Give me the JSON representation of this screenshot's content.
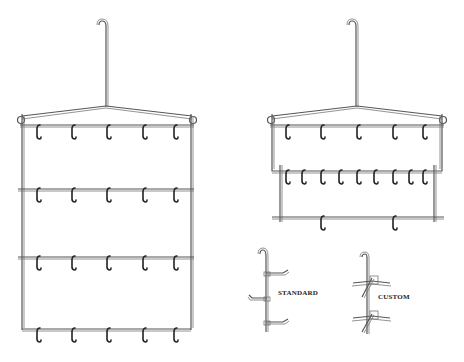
{
  "figure": {
    "left_rack": {
      "name": "four-tier hook rack",
      "tiers": [
        {
          "y": 127,
          "hooks": [
            38,
            73,
            108,
            144,
            175
          ]
        },
        {
          "y": 190,
          "hooks": [
            38,
            73,
            108,
            144,
            175
          ]
        },
        {
          "y": 258,
          "hooks": [
            38,
            73,
            108,
            144,
            175
          ]
        },
        {
          "y": 330,
          "hooks": [
            38,
            73,
            108,
            144,
            175
          ]
        }
      ]
    },
    "right_rack": {
      "name": "three-tier extended hook rack",
      "tiers": [
        {
          "y": 127,
          "hooks": [
            287,
            322,
            358,
            394,
            424
          ]
        },
        {
          "y": 172,
          "hooks": [
            287,
            303,
            322,
            340,
            358,
            375,
            394,
            410,
            424
          ]
        },
        {
          "y": 218,
          "hooks": [
            322,
            394
          ]
        }
      ]
    },
    "details": {
      "standard_label": "STANDARD",
      "custom_label": "CUSTOM"
    }
  }
}
